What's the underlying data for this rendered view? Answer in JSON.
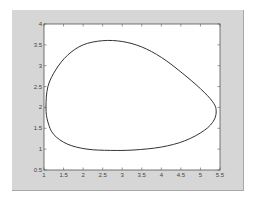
{
  "figure": {
    "background": "#d6d6d6",
    "axes_background": "#ffffff",
    "line_color": "#333333"
  },
  "chart_data": {
    "type": "line",
    "title": "",
    "xlabel": "",
    "ylabel": "",
    "xlim": [
      1,
      5.5
    ],
    "ylim": [
      0.5,
      4
    ],
    "grid": false,
    "legend": null,
    "x_ticks": [
      "1",
      "1.5",
      "2",
      "2.5",
      "3",
      "3.5",
      "4",
      "4.5",
      "5",
      "5.5"
    ],
    "y_ticks": [
      "0.5",
      "1",
      "1.5",
      "2",
      "2.5",
      "3",
      "3.5",
      "4"
    ],
    "series": [
      {
        "name": "closed orbit",
        "x": [
          1.05,
          1.1,
          1.3,
          1.6,
          2.0,
          2.5,
          3.0,
          3.5,
          4.0,
          4.5,
          5.0,
          5.3,
          5.4,
          5.35,
          5.1,
          4.6,
          4.0,
          3.3,
          2.7,
          2.1,
          1.6,
          1.25,
          1.1,
          1.05
        ],
        "y": [
          2.0,
          2.5,
          2.9,
          3.25,
          3.5,
          3.6,
          3.58,
          3.45,
          3.2,
          2.85,
          2.45,
          2.15,
          1.95,
          1.7,
          1.45,
          1.2,
          1.05,
          0.98,
          0.97,
          1.0,
          1.12,
          1.35,
          1.65,
          2.0
        ]
      }
    ]
  }
}
